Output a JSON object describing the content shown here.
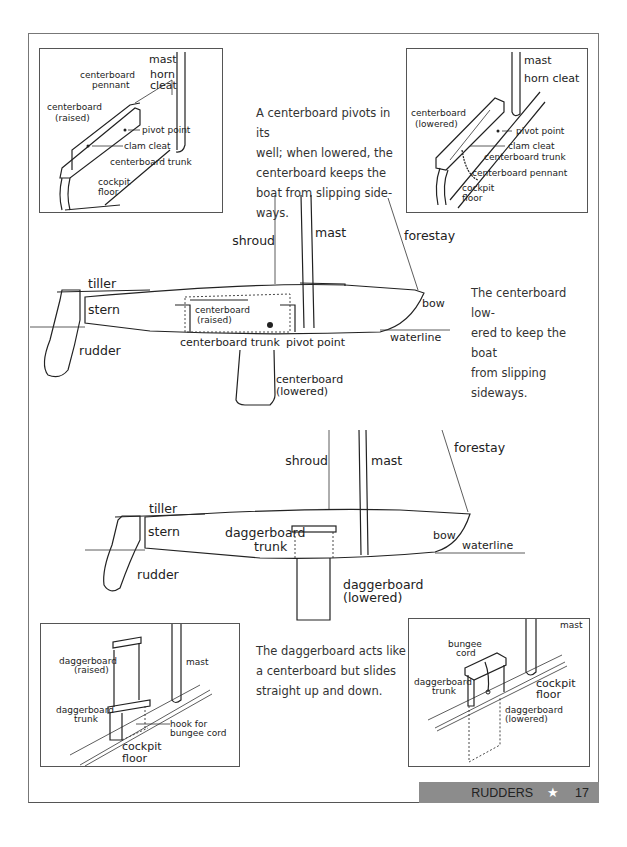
{
  "page": {
    "section": "RUDDERS",
    "page_number": "17",
    "star_icon": "star-icon"
  },
  "captions": {
    "centerboard_pivot": "A centerboard pivots in its\nwell; when lowered, the\ncenterboard keeps the\nboat from slipping side-\nways.",
    "centerboard_lowered": "The centerboard low-\nered to keep the boat\nfrom slipping sideways.",
    "daggerboard": "The daggerboard acts like\na centerboard but slides\nstraight up and down."
  },
  "inset_top_left": {
    "labels": {
      "mast": "mast",
      "pennant_1": "centerboard",
      "pennant_2": "pennant",
      "horn_1": "horn",
      "horn_2": "cleat",
      "cb_1": "centerboard",
      "cb_2": "(raised)",
      "pivot": "pivot point",
      "clam": "clam cleat",
      "trunk": "centerboard trunk",
      "floor_1": "cockpit",
      "floor_2": "floor"
    }
  },
  "inset_top_right": {
    "labels": {
      "mast": "mast",
      "horn": "horn cleat",
      "cb_1": "centerboard",
      "cb_2": "(lowered)",
      "pivot": "pivot point",
      "clam": "clam cleat",
      "trunk": "centerboard trunk",
      "pennant": "centerboard pennant",
      "floor_1": "cockpit",
      "floor_2": "floor"
    }
  },
  "boat_centerboard": {
    "labels": {
      "shroud": "shroud",
      "mast": "mast",
      "forestay": "forestay",
      "tiller": "tiller",
      "stern": "stern",
      "rudder": "rudder",
      "cb_raised_1": "centerboard",
      "cb_raised_2": "(raised)",
      "trunk": "centerboard trunk",
      "pivot": "pivot point",
      "bow": "bow",
      "waterline": "waterline",
      "cb_lowered_1": "centerboard",
      "cb_lowered_2": "(lowered)"
    }
  },
  "boat_daggerboard": {
    "labels": {
      "shroud": "shroud",
      "mast": "mast",
      "forestay": "forestay",
      "tiller": "tiller",
      "stern": "stern",
      "rudder": "rudder",
      "trunk_1": "daggerboard",
      "trunk_2": "trunk",
      "bow": "bow",
      "waterline": "waterline",
      "db_lowered_1": "daggerboard",
      "db_lowered_2": "(lowered)"
    }
  },
  "inset_bottom_left": {
    "labels": {
      "db_1": "daggerboard",
      "db_2": "(raised)",
      "mast": "mast",
      "trunk_1": "daggerboard",
      "trunk_2": "trunk",
      "hook_1": "hook for",
      "hook_2": "bungee cord",
      "floor_1": "cockpit",
      "floor_2": "floor"
    }
  },
  "inset_bottom_right": {
    "labels": {
      "mast": "mast",
      "bungee_1": "bungee",
      "bungee_2": "cord",
      "trunk_1": "daggerboard",
      "trunk_2": "trunk",
      "floor_1": "cockpit",
      "floor_2": "floor",
      "db_1": "daggerboard",
      "db_2": "(lowered)"
    }
  }
}
